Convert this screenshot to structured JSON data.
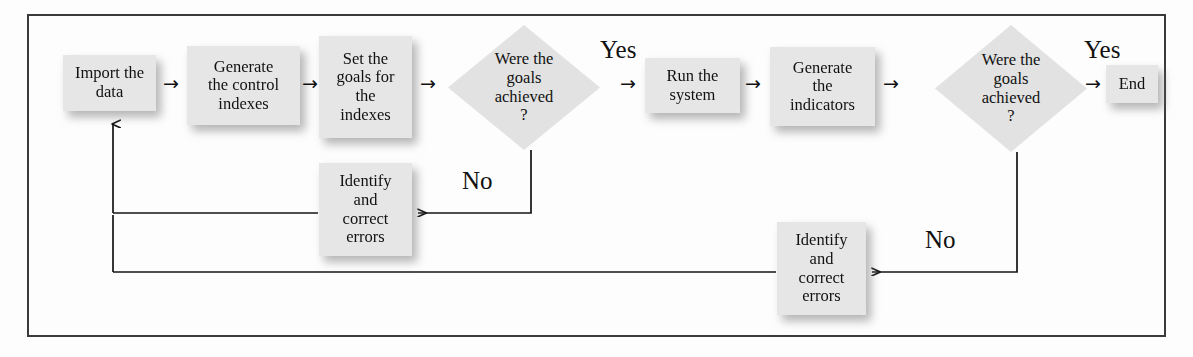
{
  "diagram": {
    "frame": {
      "border_color": "#3a3a3a"
    },
    "node_fill": "#e6e6e6",
    "line_color": "#1a1a1a",
    "nodes": {
      "import_data": "Import the\ndata",
      "generate_control_indexes": "Generate\nthe control\nindexes",
      "set_goals": "Set the\ngoals for\nthe\nindexes",
      "decision_1": "Were the\ngoals\nachieved\n?",
      "run_system": "Run the\nsystem",
      "generate_indicators": "Generate\nthe\nindicators",
      "decision_2": "Were the\ngoals\nachieved\n?",
      "end": "End",
      "identify_correct_1": "Identify\nand\ncorrect\nerrors",
      "identify_correct_2": "Identify\nand\ncorrect\nerrors"
    },
    "edge_labels": {
      "yes_1": "Yes",
      "yes_2": "Yes",
      "no_1": "No",
      "no_2": "No"
    },
    "arrows": {
      "a1": "→",
      "a2": "→",
      "a3": "→",
      "a4": "→",
      "a5": "→",
      "a6": "→",
      "a7": "→"
    }
  }
}
